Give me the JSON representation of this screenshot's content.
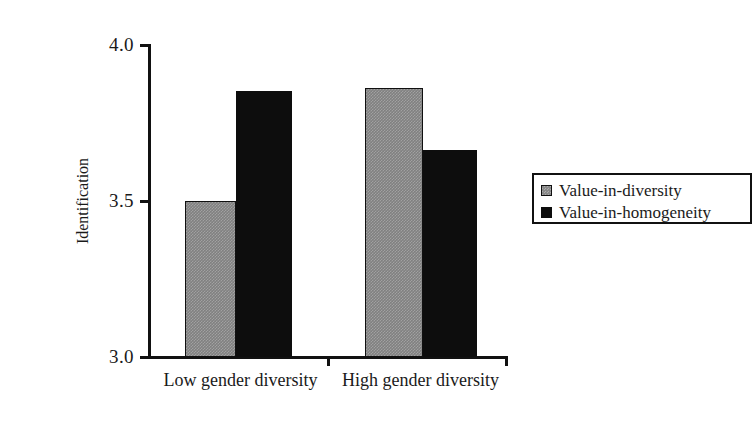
{
  "chart_data": {
    "type": "bar",
    "title": "",
    "xlabel": "",
    "ylabel": "Identification",
    "categories": [
      "Low gender diversity",
      "High gender diversity"
    ],
    "series": [
      {
        "name": "Value-in-diversity",
        "values": [
          3.5,
          3.86
        ],
        "color": "#808080"
      },
      {
        "name": "Value-in-homogeneity",
        "values": [
          3.85,
          3.66
        ],
        "color": "#0d0d0d"
      }
    ],
    "ylim": [
      3.0,
      4.0
    ],
    "ytick_labels": [
      "3.0",
      "3.5",
      "4.0"
    ],
    "ytick_values": [
      3.0,
      3.5,
      4.0
    ],
    "grid": false,
    "legend_position": "right"
  },
  "axes": {
    "y": {
      "title": "Identification",
      "ticks": [
        {
          "label": "4.0",
          "value": 4.0
        },
        {
          "label": "3.5",
          "value": 3.5
        },
        {
          "label": "3.0",
          "value": 3.0
        }
      ]
    },
    "x": {
      "categories": [
        {
          "label": "Low gender diversity"
        },
        {
          "label": "High gender diversity"
        }
      ]
    }
  },
  "legend": {
    "entries": [
      {
        "label": "Value-in-diversity",
        "swatch": "gray-square-swatch"
      },
      {
        "label": "Value-in-homogeneity",
        "swatch": "black-square-swatch"
      }
    ]
  }
}
